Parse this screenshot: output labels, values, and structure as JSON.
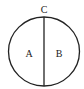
{
  "diagram": {
    "type": "circle-divided-by-diameter",
    "labels": {
      "top_point": "C",
      "left_region": "A",
      "right_region": "B"
    },
    "stroke_color": "#222222",
    "background": "#ffffff"
  }
}
